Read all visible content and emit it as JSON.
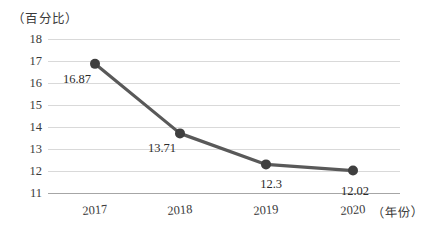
{
  "chart_data": {
    "type": "line",
    "title": "",
    "subtitle": "",
    "xlabel": "（年份）",
    "ylabel": "（百分比）",
    "categories": [
      "2017",
      "2018",
      "2019",
      "2020"
    ],
    "values": [
      16.87,
      13.71,
      12.3,
      12.02
    ],
    "point_labels": [
      "16.87",
      "13.71",
      "12.3",
      "12.02"
    ],
    "series": [
      {
        "name": "",
        "values": [
          16.87,
          13.71,
          12.3,
          12.02
        ]
      }
    ],
    "ylim": [
      11,
      18
    ],
    "y_ticks": [
      "18",
      "17",
      "16",
      "15",
      "14",
      "13",
      "12",
      "11"
    ],
    "y_tick_values": [
      18,
      17,
      16,
      15,
      14,
      13,
      12,
      11
    ],
    "grid": true,
    "legend": false,
    "legend_position": "none",
    "colors": {
      "line": "#595959",
      "marker": "#3f3f3f",
      "gridline": "#d9d9d9",
      "axis": "#a6a6a6",
      "text": "#3a3a3a",
      "background": "#ffffff"
    },
    "marker": "circle",
    "line_width": 3.2,
    "marker_size": 5
  }
}
